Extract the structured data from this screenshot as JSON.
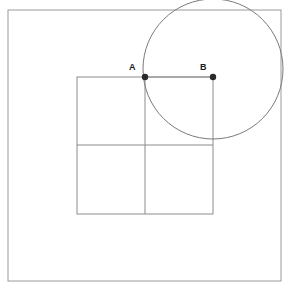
{
  "figure": {
    "title": "",
    "background_color": "#ffffff",
    "width": 298,
    "height": 294,
    "stroke_color": "#8c8c8c",
    "circle_stroke_color": "#7a7a7a",
    "point_color": "#2b2b2b",
    "label_color": "#1a1a1a"
  },
  "labels": {
    "point_a": "A",
    "point_b": "B"
  },
  "chart_data": {
    "type": "diagram",
    "title": "",
    "shapes": [
      {
        "name": "outer-frame",
        "kind": "rectangle",
        "x": 8,
        "y": 10,
        "width": 273,
        "height": 271,
        "stroke": "#9a9a9a",
        "stroke_width": 1,
        "fill": "none"
      },
      {
        "name": "inner-square",
        "kind": "rectangle",
        "x": 77,
        "y": 77,
        "width": 136,
        "height": 137,
        "stroke": "#8c8c8c",
        "stroke_width": 1,
        "fill": "none"
      },
      {
        "name": "square-vertical-midline",
        "kind": "line",
        "x1": 145,
        "y1": 77,
        "x2": 145,
        "y2": 214,
        "stroke": "#8c8c8c",
        "stroke_width": 1
      },
      {
        "name": "square-horizontal-midline",
        "kind": "line",
        "x1": 77,
        "y1": 145,
        "x2": 213,
        "y2": 145,
        "stroke": "#8c8c8c",
        "stroke_width": 1
      },
      {
        "name": "circle",
        "kind": "circle",
        "cx": 213,
        "cy": 69,
        "r": 70,
        "stroke": "#7a7a7a",
        "stroke_width": 1,
        "fill": "none"
      },
      {
        "name": "segment-ab",
        "kind": "line",
        "x1": 145,
        "y1": 77,
        "x2": 213,
        "y2": 77,
        "stroke": "#8c8c8c",
        "stroke_width": 1
      }
    ],
    "points": [
      {
        "name": "A",
        "label": "A",
        "x": 145,
        "y": 77,
        "radius": 3.2,
        "color": "#2b2b2b"
      },
      {
        "name": "B",
        "label": "B",
        "x": 213,
        "y": 77,
        "radius": 3.2,
        "color": "#2b2b2b"
      }
    ]
  }
}
